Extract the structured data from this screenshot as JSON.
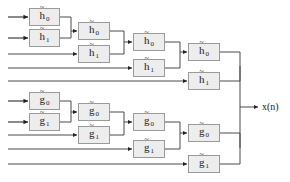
{
  "diagram": {
    "output_label": "x(n)",
    "colors": {
      "box_fill": "#ededed",
      "box_border": "#9a9a9a",
      "wire": "#4a4a4a",
      "wire_dark": "#2b2b2b",
      "text": "#1a1a1a",
      "background": "#ffffff"
    },
    "labels": {
      "h0": "h",
      "h1": "h",
      "g0": "g",
      "g1": "g",
      "tilde": "~",
      "sub0": "0",
      "sub1": "1"
    },
    "boxes": [
      {
        "id": "h0-s1",
        "base": "h",
        "tilde": "~",
        "sub": "0",
        "x": 29,
        "y": 8,
        "w": 31,
        "h": 18
      },
      {
        "id": "h1-s1",
        "base": "h",
        "tilde": "~",
        "sub": "1",
        "x": 29,
        "y": 29,
        "w": 31,
        "h": 18
      },
      {
        "id": "h0-s2",
        "base": "h",
        "tilde": "~",
        "sub": "0",
        "x": 78,
        "y": 22,
        "w": 32,
        "h": 18
      },
      {
        "id": "h1-s2",
        "base": "h",
        "tilde": "~",
        "sub": "1",
        "x": 78,
        "y": 45,
        "w": 32,
        "h": 18
      },
      {
        "id": "h0-s3",
        "base": "h",
        "tilde": "~",
        "sub": "0",
        "x": 133,
        "y": 33,
        "w": 32,
        "h": 18
      },
      {
        "id": "h1-s3",
        "base": "h",
        "tilde": "~",
        "sub": "1",
        "x": 133,
        "y": 59,
        "w": 32,
        "h": 18
      },
      {
        "id": "h0-s4",
        "base": "h",
        "tilde": "~",
        "sub": "0",
        "x": 188,
        "y": 43,
        "w": 32,
        "h": 18
      },
      {
        "id": "h1-s4",
        "base": "h",
        "tilde": "~",
        "sub": "1",
        "x": 188,
        "y": 72,
        "w": 32,
        "h": 18
      },
      {
        "id": "g0-s1",
        "base": "g",
        "tilde": "~",
        "sub": "0",
        "x": 29,
        "y": 92,
        "w": 31,
        "h": 18
      },
      {
        "id": "g1-s1",
        "base": "g",
        "tilde": "~",
        "sub": "1",
        "x": 29,
        "y": 113,
        "w": 31,
        "h": 18
      },
      {
        "id": "g0-s2",
        "base": "g",
        "tilde": "~",
        "sub": "0",
        "x": 78,
        "y": 103,
        "w": 32,
        "h": 18
      },
      {
        "id": "g1-s2",
        "base": "g",
        "tilde": "~",
        "sub": "1",
        "x": 78,
        "y": 126,
        "w": 32,
        "h": 18
      },
      {
        "id": "g0-s3",
        "base": "g",
        "tilde": "~",
        "sub": "0",
        "x": 133,
        "y": 113,
        "w": 32,
        "h": 18
      },
      {
        "id": "g1-s3",
        "base": "g",
        "tilde": "~",
        "sub": "1",
        "x": 133,
        "y": 140,
        "w": 32,
        "h": 18
      },
      {
        "id": "g0-s4",
        "base": "g",
        "tilde": "~",
        "sub": "0",
        "x": 188,
        "y": 124,
        "w": 32,
        "h": 18
      },
      {
        "id": "g1-s4",
        "base": "g",
        "tilde": "~",
        "sub": "1",
        "x": 188,
        "y": 155,
        "w": 32,
        "h": 18
      }
    ],
    "inputs": [
      {
        "id": "in-1",
        "y": 17
      },
      {
        "id": "in-2",
        "y": 38
      },
      {
        "id": "in-3",
        "y": 54
      },
      {
        "id": "in-4",
        "y": 68
      },
      {
        "id": "in-5",
        "y": 81
      },
      {
        "id": "in-6",
        "y": 101
      },
      {
        "id": "in-7",
        "y": 122
      },
      {
        "id": "in-8",
        "y": 135
      },
      {
        "id": "in-9",
        "y": 149
      },
      {
        "id": "in-10",
        "y": 164
      }
    ]
  }
}
